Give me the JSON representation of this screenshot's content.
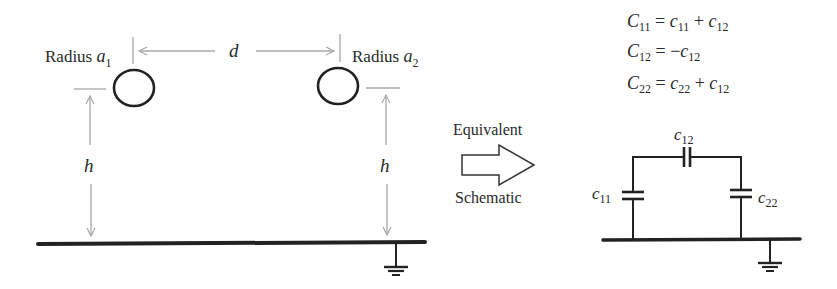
{
  "left_panel": {
    "conductor1_label": "Radius ",
    "conductor1_var": "a",
    "conductor1_sub": "1",
    "conductor2_label": "Radius ",
    "conductor2_var": "a",
    "conductor2_sub": "2",
    "separation_label": "d",
    "height_label_left": "h",
    "height_label_right": "h"
  },
  "transition": {
    "top_label": "Equivalent",
    "bottom_label": "Schematic",
    "arrow_icon": "hollow-right-arrow"
  },
  "equations": [
    {
      "lhs": "C",
      "lhs_sub": "11",
      "rhs": [
        {
          "t": " = "
        },
        {
          "v": "c",
          "s": "11"
        },
        {
          "t": " + "
        },
        {
          "v": "c",
          "s": "12"
        }
      ]
    },
    {
      "lhs": "C",
      "lhs_sub": "12",
      "rhs": [
        {
          "t": " = −"
        },
        {
          "v": "c",
          "s": "12"
        }
      ]
    },
    {
      "lhs": "C",
      "lhs_sub": "22",
      "rhs": [
        {
          "t": " = "
        },
        {
          "v": "c",
          "s": "22"
        },
        {
          "t": " + "
        },
        {
          "v": "c",
          "s": "12"
        }
      ]
    }
  ],
  "equations_text": {
    "eq1_lhs": "C",
    "eq1_lhs_sub": "11",
    "eq1_eq": " = ",
    "eq1_t1": "c",
    "eq1_t1_sub": "11",
    "eq1_plus": " + ",
    "eq1_t2": "c",
    "eq1_t2_sub": "12",
    "eq2_lhs": "C",
    "eq2_lhs_sub": "12",
    "eq2_eq": " = −",
    "eq2_t1": "c",
    "eq2_t1_sub": "12",
    "eq3_lhs": "C",
    "eq3_lhs_sub": "22",
    "eq3_eq": " = ",
    "eq3_t1": "c",
    "eq3_t1_sub": "22",
    "eq3_plus": " + ",
    "eq3_t2": "c",
    "eq3_t2_sub": "12"
  },
  "schematic": {
    "c12_var": "c",
    "c12_sub": "12",
    "c11_var": "c",
    "c11_sub": "11",
    "c22_var": "c",
    "c22_sub": "22"
  },
  "colors": {
    "line": "#222222",
    "dimension": "#a8a8a8",
    "text": "#2a2a2a"
  }
}
